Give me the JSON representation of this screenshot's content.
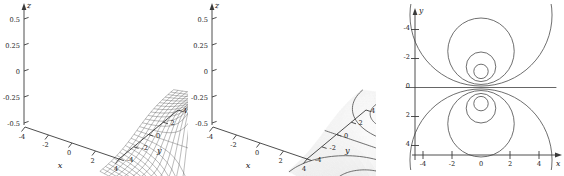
{
  "figure": {
    "background_color": "#ffffff",
    "line_color": "#3a3a3a",
    "panel_count": 3
  },
  "panels": [
    {
      "id": "wireframe-surface",
      "render_style": "mesh",
      "axis_labels": {
        "x": "x",
        "y": "y",
        "z": "z"
      },
      "z_ticks": [
        "0.5",
        "0.25",
        "0",
        "-0.25",
        "-0.5"
      ],
      "x_ticks": [
        "-4",
        "-2",
        "0",
        "2",
        "4"
      ],
      "y_ticks": [
        "-4",
        "-2",
        "0",
        "2",
        "4"
      ]
    },
    {
      "id": "shaded-surface-with-level-curves",
      "render_style": "shaded",
      "axis_labels": {
        "x": "x",
        "y": "y",
        "z": "z"
      },
      "z_ticks": [
        "0.5",
        "0.25",
        "0",
        "-0.25",
        "-0.5"
      ],
      "x_ticks": [
        "-4",
        "-2",
        "0",
        "2",
        "4"
      ],
      "y_ticks": [
        "-4",
        "-2",
        "0",
        "2",
        "4"
      ]
    },
    {
      "id": "contour-map",
      "render_style": "contour",
      "axis_labels": {
        "x": "x",
        "y": "y"
      },
      "x_ticks": [
        "-4",
        "-2",
        "0",
        "2",
        "4"
      ],
      "y_ticks": [
        "-4",
        "-2",
        "0",
        "2",
        "4"
      ]
    }
  ],
  "chart_data": [
    {
      "type": "surface",
      "title": "",
      "xlabel": "x",
      "ylabel": "y",
      "zlabel": "z",
      "function": "z = y/(x^2 + y^2 + 1)",
      "xlim": [
        -5,
        5
      ],
      "ylim": [
        -5,
        5
      ],
      "zlim": [
        -0.5,
        0.5
      ],
      "xticks": [
        -4,
        -2,
        0,
        2,
        4
      ],
      "yticks": [
        -4,
        -2,
        0,
        2,
        4
      ],
      "zticks": [
        -0.5,
        -0.25,
        0,
        0.25,
        0.5
      ],
      "style": "wireframe mesh",
      "grid": false,
      "legend": "none",
      "features": [
        {
          "name": "maximum",
          "x": 0,
          "y": 1,
          "z": 0.5
        },
        {
          "name": "minimum",
          "x": 0,
          "y": -1,
          "z": -0.5
        }
      ]
    },
    {
      "type": "surface",
      "title": "",
      "xlabel": "x",
      "ylabel": "y",
      "zlabel": "z",
      "function": "z = y/(x^2 + y^2 + 1)",
      "xlim": [
        -5,
        5
      ],
      "ylim": [
        -5,
        5
      ],
      "zlim": [
        -0.5,
        0.5
      ],
      "xticks": [
        -4,
        -2,
        0,
        2,
        4
      ],
      "yticks": [
        -4,
        -2,
        0,
        2,
        4
      ],
      "zticks": [
        -0.5,
        -0.25,
        0,
        0.25,
        0.5
      ],
      "style": "shaded surface with level curves traced on it",
      "grid": false,
      "legend": "none",
      "contour_levels": [
        -0.4,
        -0.3,
        -0.2,
        -0.1,
        0,
        0.1,
        0.2,
        0.3,
        0.4
      ],
      "features": [
        {
          "name": "maximum",
          "x": 0,
          "y": 1,
          "z": 0.5
        },
        {
          "name": "minimum",
          "x": 0,
          "y": -1,
          "z": -0.5
        }
      ]
    },
    {
      "type": "contour",
      "title": "",
      "xlabel": "x",
      "ylabel": "y",
      "function": "y/(x^2 + y^2 + 1) = c",
      "xlim": [
        -5.2,
        5.2
      ],
      "ylim": [
        -5.2,
        5.2
      ],
      "xticks": [
        -4,
        -2,
        0,
        2,
        4
      ],
      "yticks": [
        -4,
        -2,
        0,
        2,
        4
      ],
      "grid": false,
      "legend": "none",
      "level_curve_form": "circles x^2 + (y - 1/(2c))^2 = 1/(4c^2) - 1",
      "levels": [
        0.45,
        0.35,
        0.2,
        0.1,
        0,
        -0.1,
        -0.2,
        -0.35,
        -0.45
      ],
      "curves": [
        {
          "level": 0.45,
          "center": [
            0,
            1.111
          ],
          "radius": 0.4969
        },
        {
          "level": 0.35,
          "center": [
            0,
            1.4286
          ],
          "radius": 1.0202
        },
        {
          "level": 0.2,
          "center": [
            0,
            2.5
          ],
          "radius": 2.2913
        },
        {
          "level": 0.1,
          "center": [
            0,
            5.0
          ],
          "radius": 4.899
        },
        {
          "level": 0,
          "center": null,
          "radius": null,
          "shape": "horizontal line y = 0"
        },
        {
          "level": -0.1,
          "center": [
            0,
            -5.0
          ],
          "radius": 4.899
        },
        {
          "level": -0.2,
          "center": [
            0,
            -2.5
          ],
          "radius": 2.2913
        },
        {
          "level": -0.35,
          "center": [
            0,
            -1.4286
          ],
          "radius": 1.0202
        },
        {
          "level": -0.45,
          "center": [
            0,
            -1.111
          ],
          "radius": 0.4969
        }
      ]
    }
  ]
}
